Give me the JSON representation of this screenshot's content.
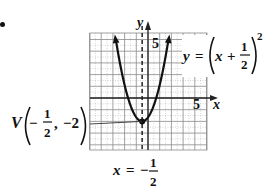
{
  "chart_data": {
    "type": "line",
    "title": "",
    "equation": {
      "lhs": "y",
      "equals": "=",
      "base_var": "x",
      "plus": "+",
      "frac_num": "1",
      "frac_den": "2",
      "exponent": "2",
      "text": "y = (x + 1/2)^2"
    },
    "function": "y = (x + 1/2)^2",
    "vertex": {
      "x": -0.5,
      "y": -2
    },
    "vertex_label": {
      "letter": "V",
      "minus": "−",
      "frac_num": "1",
      "frac_den": "2",
      "comma": ",",
      "y_value": "−2",
      "text": "V(−1/2, −2)"
    },
    "axis_of_symmetry": {
      "lhs": "x",
      "equals": "=",
      "minus": "−",
      "frac_num": "1",
      "frac_den": "2",
      "value": -0.5,
      "text": "x = −1/2",
      "style": "dashed"
    },
    "xlabel": "x",
    "ylabel": "y",
    "x_tick_label": "5",
    "y_tick_label": "5",
    "xlim": [
      -5,
      5
    ],
    "ylim": [
      -5,
      5
    ],
    "grid": true,
    "curve_points": [
      {
        "x": -4.0,
        "y": 5.0
      },
      {
        "x": -3.0,
        "y": 2.25
      },
      {
        "x": -2.0,
        "y": 0.25
      },
      {
        "x": -1.0,
        "y": -1.75
      },
      {
        "x": -0.5,
        "y": -2.0
      },
      {
        "x": 0.0,
        "y": -1.75
      },
      {
        "x": 1.0,
        "y": 0.25
      },
      {
        "x": 2.0,
        "y": 2.25
      },
      {
        "x": 3.0,
        "y": 5.0
      }
    ]
  },
  "colors": {
    "grid_major": "#8a8a8a",
    "grid_minor": "#b8b8b8",
    "axis": "#222222",
    "curve": "#111111",
    "background": "#ffffff"
  }
}
